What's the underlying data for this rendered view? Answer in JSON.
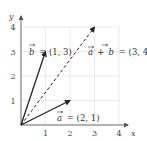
{
  "diagram": {
    "type": "vector-addition",
    "axes": {
      "x_label": "x",
      "y_label": "y",
      "x_ticks": [
        "1",
        "2",
        "3",
        "4"
      ],
      "y_ticks": [
        "1",
        "2",
        "3",
        "4"
      ],
      "range": {
        "x": [
          0,
          4
        ],
        "y": [
          0,
          4
        ]
      },
      "grid": true
    },
    "vectors": [
      {
        "id": "a",
        "from": [
          0,
          0
        ],
        "to": [
          2,
          1
        ],
        "style": "solid",
        "label_var": "a",
        "label_value": "= (2, 1)"
      },
      {
        "id": "b",
        "from": [
          0,
          0
        ],
        "to": [
          1,
          3
        ],
        "style": "solid",
        "label_var": "b",
        "label_value": "= (1, 3)"
      },
      {
        "id": "a_plus_b",
        "from": [
          0,
          0
        ],
        "to": [
          3,
          4
        ],
        "style": "dashed",
        "label_var1": "a",
        "label_op": "+",
        "label_var2": "b",
        "label_value": "= (3, 4)"
      }
    ],
    "colors": {
      "grid": "#e4e4e4",
      "axis": "#555555",
      "vector": "#222222",
      "text": "#333333"
    }
  }
}
